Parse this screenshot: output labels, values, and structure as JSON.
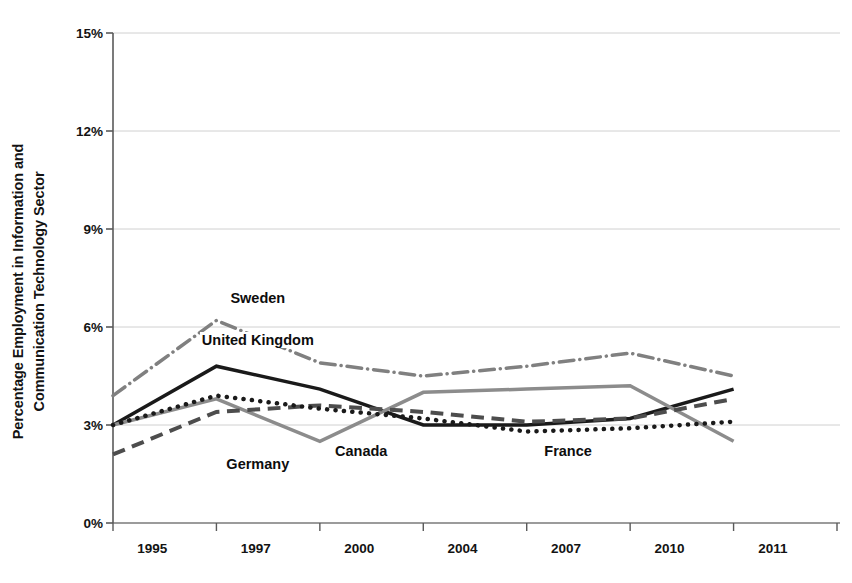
{
  "chart_data": {
    "type": "line",
    "title": "",
    "xlabel": "",
    "ylabel": "Percentage Employment in Information and Communication Technology Sector",
    "ylabel_line1": "Percentage Employment in Information and",
    "ylabel_line2": "Communication Technology Sector",
    "categories": [
      "1995",
      "1997",
      "2000",
      "2004",
      "2007",
      "2010",
      "2011"
    ],
    "x": [
      "1995",
      "1997",
      "2000",
      "2004",
      "2007",
      "2010",
      "2011"
    ],
    "ylim": [
      0,
      15
    ],
    "yticks": [
      0,
      3,
      6,
      9,
      12,
      15
    ],
    "ytick_labels": [
      "0%",
      "3%",
      "6%",
      "9%",
      "12%",
      "15%"
    ],
    "grid": true,
    "grid_axis": "y",
    "legend_position": "inline-annotations",
    "series": [
      {
        "name": "Sweden",
        "values": [
          3.9,
          6.2,
          4.9,
          4.5,
          4.8,
          5.2,
          4.5
        ],
        "style": "dash-dot",
        "color": "#808080",
        "width": 3.5,
        "label_x": "1997",
        "label_y": 6.9
      },
      {
        "name": "United Kingdom",
        "values": [
          3.0,
          4.8,
          4.1,
          3.0,
          3.0,
          3.2,
          4.1
        ],
        "style": "solid",
        "color": "#1a1a1a",
        "width": 3.5,
        "label_x": "1997",
        "label_y": 5.6
      },
      {
        "name": "Canada",
        "values": [
          3.0,
          3.8,
          2.5,
          4.0,
          4.1,
          4.2,
          2.5
        ],
        "style": "solid",
        "color": "#8c8c8c",
        "width": 3.5,
        "label_x": "2000",
        "label_y": 2.2
      },
      {
        "name": "Germany",
        "values": [
          2.1,
          3.4,
          3.6,
          3.4,
          3.1,
          3.2,
          3.8
        ],
        "style": "dashed",
        "color": "#4d4d4d",
        "width": 4,
        "label_x": "1997",
        "label_y": 1.8
      },
      {
        "name": "France",
        "values": [
          3.0,
          3.9,
          3.5,
          3.2,
          2.8,
          2.9,
          3.1
        ],
        "style": "dotted",
        "color": "#1a1a1a",
        "width": 4.5,
        "label_x": "2007",
        "label_y": 2.2
      }
    ],
    "annotations": [
      {
        "text": "Sweden"
      },
      {
        "text": "United Kingdom"
      },
      {
        "text": "Canada"
      },
      {
        "text": "Germany"
      },
      {
        "text": "France"
      }
    ]
  }
}
